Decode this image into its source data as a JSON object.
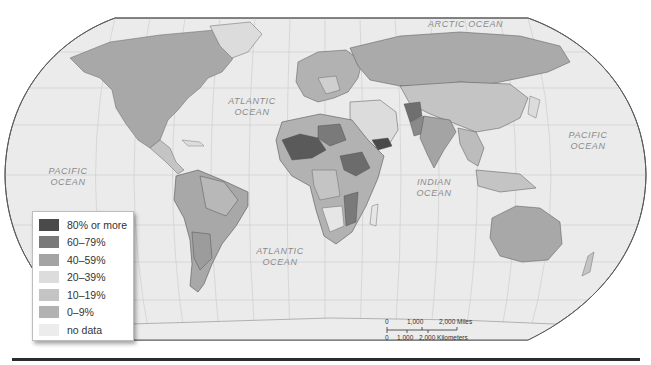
{
  "map": {
    "projection": "Robinson world map",
    "colors": {
      "water": "#ebebeb",
      "graticule": "#cfcfcf",
      "border": "#555555",
      "frame": "#5a5a5a"
    }
  },
  "ocean_labels": {
    "arctic": "ARCTIC OCEAN",
    "atlantic_north_line1": "ATLANTIC",
    "atlantic_north_line2": "OCEAN",
    "atlantic_south_line1": "ATLANTIC",
    "atlantic_south_line2": "OCEAN",
    "pacific_east_line1": "PACIFIC",
    "pacific_east_line2": "OCEAN",
    "pacific_west_line1": "PACIFIC",
    "pacific_west_line2": "OCEAN",
    "indian_line1": "INDIAN",
    "indian_line2": "OCEAN"
  },
  "legend": {
    "items": [
      {
        "label": "80% or more",
        "color": "#4a4a4a"
      },
      {
        "label": "60–79%",
        "color": "#7a7a7a"
      },
      {
        "label": "40–59%",
        "color": "#a4a4a4"
      },
      {
        "label": "20–39%",
        "color": "#dcdcdc"
      },
      {
        "label": "10–19%",
        "color": "#c4c4c4"
      },
      {
        "label": "0–9%",
        "color": "#b2b2b2"
      },
      {
        "label": "no data",
        "color": "#ececec"
      }
    ]
  },
  "scale_bar": {
    "miles_labels": [
      "0",
      "1,000",
      "2,000 Miles"
    ],
    "km_labels": [
      "0",
      "1,000",
      "2,000 Kilometers"
    ]
  }
}
